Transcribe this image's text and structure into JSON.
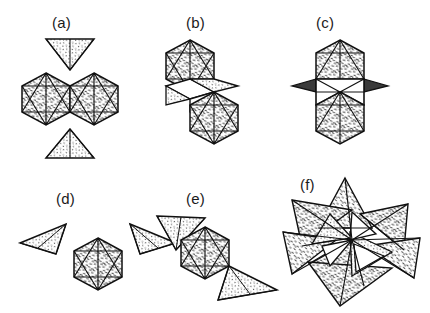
{
  "figure": {
    "background": "#ffffff",
    "ink": "#111111",
    "stipple_color": "#2b2b2b",
    "caption_color": "#1b1b1b",
    "panels": [
      {
        "id": "a",
        "label": "(a)",
        "label_x": 52,
        "label_y": 14,
        "description": "Two vertex-sharing icosahedra shown as hexagonal outlines side by side, with one separate downward-pointing tetrahedron above and one upward-pointing tetrahedron below",
        "origin_x": 18,
        "origin_y": 30,
        "polyhedra_count": 4
      },
      {
        "id": "b",
        "label": "(b)",
        "label_x": 186,
        "label_y": 14,
        "description": "Two icosahedra offset diagonally, joined through a pair of unshaded rhombic faces between them",
        "origin_x": 158,
        "origin_y": 30,
        "polyhedra_count": 4
      },
      {
        "id": "c",
        "label": "(c)",
        "label_x": 316,
        "label_y": 14,
        "description": "Two vertically stacked icosahedra sharing a central band of unshaded faces, with small dark triangular spikes projecting left and right",
        "origin_x": 288,
        "origin_y": 30,
        "polyhedra_count": 4
      },
      {
        "id": "d",
        "label": "(d)",
        "label_x": 56,
        "label_y": 190,
        "description": "One central icosahedron with two tetrahedral wings attached at its upper left and upper right vertices",
        "origin_x": 12,
        "origin_y": 205,
        "polyhedra_count": 3
      },
      {
        "id": "e",
        "label": "(e)",
        "label_x": 186,
        "label_y": 190,
        "description": "One central icosahedron with tetrahedra attached diagonally at the upper left and lower right vertices",
        "origin_x": 150,
        "origin_y": 205,
        "polyhedra_count": 3
      },
      {
        "id": "f",
        "label": "(f)",
        "label_x": 300,
        "label_y": 176,
        "description": "Dense star-shaped cluster of interpenetrating stippled tetrahedra radiating from a common central vertex",
        "origin_x": 278,
        "origin_y": 180,
        "polyhedra_count": 9
      }
    ]
  }
}
